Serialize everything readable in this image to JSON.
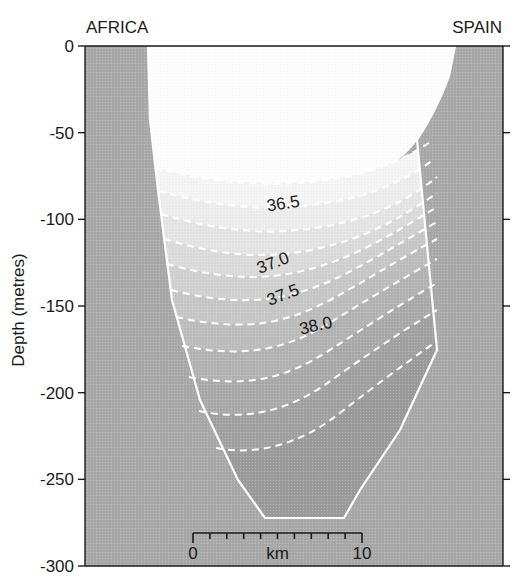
{
  "figure": {
    "width": 526,
    "height": 583,
    "background": "#ffffff"
  },
  "labels": {
    "left_landmass": "AFRICA",
    "right_landmass": "SPAIN",
    "y_axis_title": "Depth (metres)"
  },
  "colors": {
    "text": "#1a1a1a",
    "axis": "#1a1a1a",
    "contour_line": "#ffffff",
    "seabed_fill": "#a9a9a9",
    "plot_background": "#a9a9a9",
    "water_bands": [
      "#fefefe",
      "#f7f7f7",
      "#efefef",
      "#e6e6e6",
      "#dcdcdc",
      "#d2d2d2",
      "#c8c8c8",
      "#bebebe",
      "#b4b4b4",
      "#ababab",
      "#a2a2a2",
      "#9b9b9b"
    ]
  },
  "chart_data": {
    "type": "heatmap",
    "title": "",
    "subtitle": "",
    "xlabel": "km",
    "ylabel": "Depth (metres)",
    "xlim": [
      -2.4,
      16.6
    ],
    "ylim": [
      -300,
      0
    ],
    "grid": false,
    "legend_position": "none",
    "variable": "salinity",
    "variable_units": "PSU",
    "yticks": [
      0,
      -50,
      -100,
      -150,
      -200,
      -250,
      -300
    ],
    "ytick_labels": [
      "0",
      "-50",
      "-100",
      "-150",
      "-200",
      "-250",
      "-300"
    ],
    "scalebar": {
      "start_label": "0",
      "end_label": "10",
      "unit_label": "km",
      "start_km": 0,
      "end_km": 10,
      "minor_tick_count": 9
    },
    "contour_labels": [
      {
        "value": "36.5",
        "x_px": 284,
        "y_px": 209,
        "rotation": -9
      },
      {
        "value": "37.0",
        "x_px": 275,
        "y_px": 268,
        "rotation": -21
      },
      {
        "value": "37.5",
        "x_px": 285,
        "y_px": 300,
        "rotation": -21
      },
      {
        "value": "38.0",
        "x_px": 317,
        "y_px": 331,
        "rotation": -13
      }
    ],
    "contour_levels": [
      36.0,
      36.25,
      36.5,
      36.75,
      37.0,
      37.25,
      37.5,
      37.75,
      38.0,
      38.25,
      38.4
    ],
    "isohalines": [
      {
        "level": 36.0,
        "path": "M 155,168 C 185,176 215,181 248,183 C 281,185 316,183 350,176 C 382,169 410,156 430,142"
      },
      {
        "level": 36.25,
        "path": "M 158,191 C 188,199 218,205 250,207 C 283,209 318,206 352,198 C 384,190 412,176 433,160"
      },
      {
        "level": 36.5,
        "path": "M 161,214 C 191,223 221,229 253,231 C 286,233 320,229 353,220 C 386,211 415,195 437,177"
      },
      {
        "level": 36.75,
        "path": "M 164,239 C 194,248 223,254 254,255 C 286,256 318,250 349,240 C 381,229 410,212 437,193"
      },
      {
        "level": 37.0,
        "path": "M 167,264 C 196,272 224,277 253,277 C 283,277 313,270 343,258 C 375,245 406,226 437,207"
      },
      {
        "level": 37.25,
        "path": "M 171,290 C 199,297 226,301 253,300 C 281,299 309,291 337,278 C 368,263 402,242 437,222"
      },
      {
        "level": 37.5,
        "path": "M 176,317 C 203,323 229,326 254,324 C 280,322 306,313 332,299 C 363,282 400,259 437,239"
      },
      {
        "level": 37.75,
        "path": "M 182,346 C 208,351 233,353 257,350 C 282,347 307,337 331,322 C 362,303 400,280 437,259"
      },
      {
        "level": 38.0,
        "path": "M 189,377 C 214,382 238,383 261,379 C 285,375 309,364 333,348 C 364,328 401,304 437,283"
      },
      {
        "level": 38.25,
        "path": "M 199,411 C 222,416 245,416 267,411 C 290,406 313,394 336,377 C 367,355 402,331 437,310"
      },
      {
        "level": 38.4,
        "path": "M 216,448 C 237,452 258,451 279,445 C 301,439 323,427 345,409 C 375,386 407,362 437,341"
      }
    ],
    "water_bands": [
      {
        "level_top": null,
        "level_bottom": 36.0,
        "fill": "#fefefe",
        "path": "M 148,46 L 455,46 L 449,76 C 441,98 430,120 417,140 C 400,164 378,174 350,176 C 316,183 281,185 248,183 C 215,181 185,176 155,168 L 150,120 L 148,46 Z"
      },
      {
        "level_top": 36.0,
        "level_bottom": 36.25,
        "fill": "#f6f6f6",
        "path": "M 155,168 C 185,176 215,181 248,183 C 281,185 316,183 350,176 C 382,169 410,156 430,142 L 433,160 C 412,176 384,190 352,198 C 318,206 283,209 250,207 C 218,205 188,199 158,191 Z"
      },
      {
        "level_top": 36.25,
        "level_bottom": 36.5,
        "fill": "#eeeeee",
        "path": "M 158,191 C 188,199 218,205 250,207 C 283,209 318,206 352,198 C 384,190 412,176 433,160 L 437,177 C 415,195 386,211 353,220 C 320,229 286,233 253,231 C 221,229 191,223 161,214 Z"
      },
      {
        "level_top": 36.5,
        "level_bottom": 36.75,
        "fill": "#e5e5e5",
        "path": "M 161,214 C 191,223 221,229 253,231 C 286,233 320,229 353,220 C 386,211 415,195 437,177 L 437,193 C 410,212 381,229 349,240 C 318,250 286,256 254,255 C 223,254 194,248 164,239 Z"
      },
      {
        "level_top": 36.75,
        "level_bottom": 37.0,
        "fill": "#dbdbdb",
        "path": "M 164,239 C 194,248 223,254 254,255 C 286,256 318,250 349,240 C 381,229 410,212 437,193 L 437,207 C 406,226 375,245 343,258 C 313,270 283,277 253,277 C 224,277 196,272 167,264 Z"
      },
      {
        "level_top": 37.0,
        "level_bottom": 37.25,
        "fill": "#d1d1d1",
        "path": "M 167,264 C 196,272 224,277 253,277 C 283,277 313,270 343,258 C 375,245 406,226 437,207 L 437,222 C 402,242 368,263 337,278 C 309,291 281,299 253,300 C 226,301 199,297 171,290 Z"
      },
      {
        "level_top": 37.25,
        "level_bottom": 37.5,
        "fill": "#c7c7c7",
        "path": "M 171,290 C 199,297 226,301 253,300 C 281,299 309,291 337,278 C 368,263 402,242 437,222 L 437,239 C 400,259 363,282 332,299 C 306,313 280,322 254,324 C 229,326 203,323 176,317 Z"
      },
      {
        "level_top": 37.5,
        "level_bottom": 37.75,
        "fill": "#bdbdbd",
        "path": "M 176,317 C 203,323 229,326 254,324 C 280,322 306,313 332,299 C 363,282 400,259 437,239 L 437,259 C 400,280 362,303 331,322 C 307,337 282,347 257,350 C 233,353 208,351 182,346 Z"
      },
      {
        "level_top": 37.75,
        "level_bottom": 38.0,
        "fill": "#b3b3b3",
        "path": "M 182,346 C 208,351 233,353 257,350 C 282,347 307,337 331,322 C 362,303 400,280 437,259 L 437,283 C 401,304 364,328 333,348 C 309,364 285,375 261,379 C 238,383 214,382 189,377 Z"
      },
      {
        "level_top": 38.0,
        "level_bottom": 38.25,
        "fill": "#aaaaaa",
        "path": "M 189,377 C 214,382 238,383 261,379 C 285,375 309,364 333,348 C 364,328 401,304 437,283 L 437,310 C 402,331 367,355 336,377 C 313,394 290,406 267,411 C 245,416 222,416 199,411 Z"
      },
      {
        "level_top": 38.25,
        "level_bottom": 38.4,
        "fill": "#a2a2a2",
        "path": "M 199,411 C 222,416 245,416 267,411 C 290,406 313,394 336,377 C 367,355 402,331 437,310 L 437,341 C 407,362 375,386 345,409 C 323,427 301,439 279,445 C 258,451 237,452 216,448 Z"
      },
      {
        "level_top": 38.4,
        "level_bottom": null,
        "fill": "#9b9b9b",
        "path": "M 216,448 C 237,452 258,451 279,445 C 301,439 323,427 345,409 C 375,386 407,362 437,341 L 437,350 L 400,430 L 360,490 L 344,518 L 265,518 L 238,480 Z"
      }
    ],
    "water_column_outline": "M 148,46 L 455,46 L 449,76 C 441,98 430,120 417,140 L 437,350 L 400,430 L 360,490 L 344,518 L 265,518 L 238,480 L 200,400 L 172,300 L 158,190 L 150,120 Z",
    "seabed_left_path": "M 85,46 L 148,46 L 150,120 L 158,190 L 172,300 L 200,400 L 238,480 L 265,518 L 265,566 L 85,566 Z",
    "seabed_right_path": "M 455,46 L 503,46 L 503,566 L 344,566 L 344,518 L 360,490 L 400,430 L 437,350 L 417,140 C 430,120 441,98 449,76 Z"
  },
  "axes": {
    "plot_left_px": 85,
    "plot_right_px": 503,
    "plot_top_px": 46,
    "plot_bottom_px": 566
  }
}
